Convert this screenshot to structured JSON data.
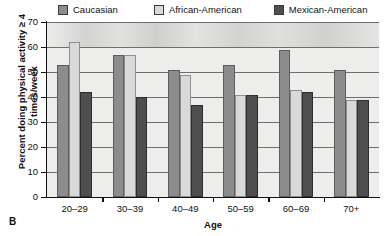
{
  "panel": {
    "label": "B"
  },
  "legend": {
    "position": "top",
    "items": [
      {
        "label": "Caucasian",
        "color": "#8c8c8c",
        "swatch_icon": "legend-swatch-icon"
      },
      {
        "label": "African-American",
        "color": "#d9d9d9",
        "swatch_icon": "legend-swatch-icon"
      },
      {
        "label": "Mexican-American",
        "color": "#4e4e4e",
        "swatch_icon": "legend-swatch-icon"
      }
    ]
  },
  "axes": {
    "ylabel": "Percent doing physical activity ≥ 4 times/week",
    "xlabel": "Age",
    "yticks": [
      70,
      60,
      50,
      40,
      30,
      20,
      10,
      0
    ]
  },
  "chart_data": {
    "type": "bar",
    "title": "",
    "xlabel": "Age",
    "ylabel": "Percent doing physical activity ≥ 4 times/week",
    "categories": [
      "20–29",
      "30–39",
      "40–49",
      "50–59",
      "60–69",
      "70+"
    ],
    "series": [
      {
        "name": "Caucasian",
        "color": "#8c8c8c",
        "values": [
          53,
          57,
          51,
          53,
          59,
          51
        ]
      },
      {
        "name": "African-American",
        "color": "#d9d9d9",
        "values": [
          62,
          57,
          49,
          41,
          43,
          39
        ]
      },
      {
        "name": "Mexican-American",
        "color": "#4e4e4e",
        "values": [
          42,
          40,
          37,
          41,
          42,
          39
        ]
      }
    ],
    "ylim": [
      0,
      70
    ],
    "ytick_step": 10,
    "grid": true,
    "legend_position": "top"
  }
}
